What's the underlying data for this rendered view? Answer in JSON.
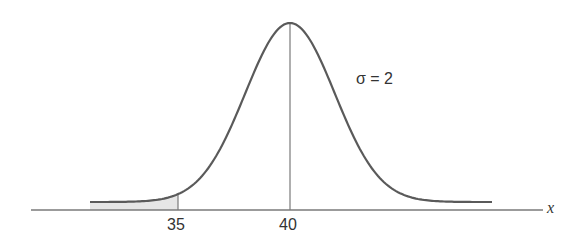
{
  "chart_data": {
    "type": "area",
    "title": "",
    "distribution": "normal",
    "mean": 40,
    "sigma": 2,
    "xlabel": "x",
    "ylabel": "",
    "tick_labels": [
      "35",
      "40"
    ],
    "shaded_region": {
      "from": "left tail",
      "to": 35
    },
    "annotation": "σ = 2",
    "colors": {
      "curve": "#5a5a5a",
      "axis": "#7a7a7a",
      "shade": "#e4e4e4"
    }
  },
  "labels": {
    "sigma": "σ = 2",
    "tick35": "35",
    "tick40": "40",
    "xaxis": "x"
  }
}
